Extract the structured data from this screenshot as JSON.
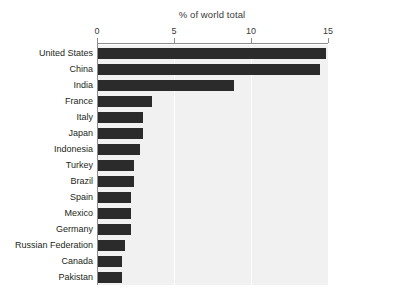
{
  "chart_data": {
    "type": "bar",
    "orientation": "horizontal",
    "title": "% of world total",
    "xlabel": "",
    "ylabel": "",
    "xlim": [
      0,
      15
    ],
    "xticks": [
      0,
      5,
      10,
      15
    ],
    "xtick_labels": [
      "0",
      "5",
      "10",
      "15"
    ],
    "grid": true,
    "grid_axis": "x",
    "legend": false,
    "bar_color": "#2b2b2b",
    "plot_background": "#f1f1f1",
    "gridline_color": "#ffffff",
    "axis_color": "#8d8d8d",
    "categories": [
      "United States",
      "China",
      "India",
      "France",
      "Italy",
      "Japan",
      "Indonesia",
      "Turkey",
      "Brazil",
      "Spain",
      "Mexico",
      "Germany",
      "Russian Federation",
      "Canada",
      "Pakistan"
    ],
    "values": [
      14.9,
      14.5,
      8.9,
      3.6,
      3.0,
      3.0,
      2.8,
      2.4,
      2.4,
      2.2,
      2.2,
      2.2,
      1.8,
      1.6,
      1.6
    ]
  }
}
